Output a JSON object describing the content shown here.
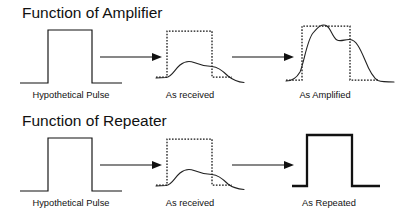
{
  "figure": {
    "title_sections": [
      {
        "id": "amplifier",
        "heading": "Function of Amplifier",
        "heading_x": 22,
        "heading_y": 18,
        "panels": [
          {
            "id": "amp-input",
            "caption": "Hypothetical Pulse",
            "caption_x": 71,
            "caption_y": 98
          },
          {
            "id": "amp-received",
            "caption": "As received",
            "caption_x": 190,
            "caption_y": 98
          },
          {
            "id": "amp-output",
            "caption": "As Amplified",
            "caption_x": 325,
            "caption_y": 98
          }
        ]
      },
      {
        "id": "repeater",
        "heading": "Function of Repeater",
        "heading_x": 22,
        "heading_y": 126,
        "panels": [
          {
            "id": "rep-input",
            "caption": "Hypothetical Pulse",
            "caption_x": 71,
            "caption_y": 206
          },
          {
            "id": "rep-received",
            "caption": "As received",
            "caption_x": 190,
            "caption_y": 206
          },
          {
            "id": "rep-output",
            "caption": "As Repeated",
            "caption_x": 329,
            "caption_y": 206
          }
        ]
      }
    ],
    "colors": {
      "ink": "#111111",
      "background": "#ffffff",
      "curve": "#222222"
    },
    "geometry": {
      "ideal_pulse_top_row": "M20,83 L48,83 L48,30 L92,30 L92,83 L122,83",
      "ideal_pulse_bottom_row": "M20,191 L48,191 L48,138 L92,138 L92,191 L122,191",
      "dashed_box_received_top": "M156,77 L167,77 L167,31 L212,31 L212,77 L232,77",
      "dashed_box_received_bottom": "M156,185 L167,185 L167,139 L212,139 L212,185 L232,185",
      "dashed_box_amplified": "M286,80 L302,80 L302,26 L350,26 L350,80 L378,80",
      "repeated_pulse": "M292,186 L307,186 L307,135 L352,135 L352,186 L380,186",
      "received_curve_top": "M156,78 L166,77.5 C172,77 174,70 180,65 C185,61 189,60.5 194,62.5 C200,65 204,66 212,66.5 C218,67 222,70 228,76 C233,80 238,82 244,82.5",
      "received_curve_bottom": "M156,186 L166,185.5 C172,185 174,178 180,173 C185,169 189,168.5 194,170.5 C200,173 204,174 212,174.5 C218,175 222,178 228,184 C233,188 238,189 244,189.5",
      "amplified_curve": "M286,81 C292,81 296,79 300,72 C304,63 307,40 313,33 C318,27 322,23 327,26 C331,29 333,38 337,40 C341,42 345,39 350,39.5 C356,40 360,48 365,60 C369,70 373,78 378,80.5 C382,82 388,82 394,82",
      "arrows": [
        {
          "id": "arrow-amp-1",
          "x1": 100,
          "y1": 57,
          "x2": 158,
          "y2": 57
        },
        {
          "id": "arrow-amp-2",
          "x1": 232,
          "y1": 57,
          "x2": 292,
          "y2": 57
        },
        {
          "id": "arrow-rep-1",
          "x1": 100,
          "y1": 165,
          "x2": 158,
          "y2": 165
        },
        {
          "id": "arrow-rep-2",
          "x1": 232,
          "y1": 165,
          "x2": 292,
          "y2": 165
        }
      ]
    }
  }
}
